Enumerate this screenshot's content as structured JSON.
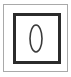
{
  "canvas": {
    "width": 71,
    "height": 77,
    "background_color": "#ffffff"
  },
  "icon": {
    "name": "framed-oval-icon",
    "description": "Square outline frame containing a vertical oval",
    "alt_text": "0",
    "outer_frame": {
      "name": "outer-frame",
      "stroke_color": "#a9a9a9",
      "stroke_width": 1,
      "x": 3.5,
      "y": 4.5,
      "width": 64,
      "height": 67
    },
    "inner_frame": {
      "name": "inner-frame",
      "stroke_color": "#2b2b2b",
      "stroke_width": 3,
      "x": 14.5,
      "y": 14.5,
      "width": 45,
      "height": 48
    },
    "inner_frame_gap": {
      "name": "inner-frame-inner-highlight",
      "stroke_color": "#ffffff",
      "stroke_width": 1,
      "x": 17.5,
      "y": 17.5,
      "width": 39,
      "height": 42
    },
    "center_shape": {
      "name": "center-oval",
      "glyph": "0",
      "stroke_color": "#3a3a3a",
      "stroke_width": 1.6,
      "fill": "none",
      "cx": 36,
      "cy": 38.5,
      "rx": 6,
      "ry": 13.5
    }
  }
}
